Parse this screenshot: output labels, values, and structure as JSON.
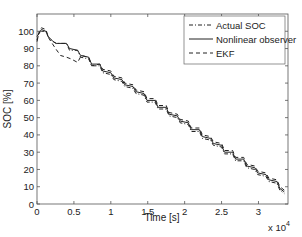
{
  "chart_data": {
    "type": "line",
    "title": "",
    "xlabel": "Time [s]",
    "ylabel": "SOC [%]",
    "x_multiplier_label": "x 10",
    "x_multiplier_exp": "4",
    "xlim": [
      0,
      34000
    ],
    "ylim": [
      0,
      110
    ],
    "xticks": [
      0,
      5000,
      10000,
      15000,
      20000,
      25000,
      30000
    ],
    "xtick_labels": [
      "0",
      "0.5",
      "1",
      "1.5",
      "2",
      "2.5",
      "3"
    ],
    "yticks": [
      0,
      10,
      20,
      30,
      40,
      50,
      60,
      70,
      80,
      90,
      100
    ],
    "ytick_labels": [
      "0",
      "10",
      "20",
      "30",
      "40",
      "50",
      "60",
      "70",
      "80",
      "90",
      "100"
    ],
    "grid": false,
    "legend_position": "upper right",
    "series": [
      {
        "name": "Actual SOC",
        "style": "dashdot",
        "x": [
          0,
          300,
          600,
          1200,
          1500,
          2200,
          2600,
          4000,
          4400,
          5500,
          5900,
          7000,
          7400,
          8500,
          8900,
          10000,
          10400,
          11500,
          11900,
          13000,
          13400,
          14500,
          14900,
          16000,
          16400,
          17500,
          17900,
          19000,
          19400,
          20500,
          20900,
          22000,
          22400,
          23500,
          23900,
          25000,
          25400,
          26500,
          26900,
          28000,
          28400,
          29500,
          29900,
          31000,
          31400,
          32500,
          32900,
          33500
        ],
        "y": [
          95,
          99,
          100,
          100,
          97,
          94,
          93,
          93,
          89,
          89,
          85,
          84,
          80,
          80,
          76,
          75,
          72,
          71,
          68,
          67,
          64,
          63,
          59,
          59,
          55,
          55,
          51,
          50,
          47,
          46,
          42,
          42,
          38,
          37,
          34,
          33,
          29,
          29,
          25,
          25,
          21,
          20,
          17,
          16,
          13,
          12,
          8,
          6
        ]
      },
      {
        "name": "Nonlinear observer",
        "style": "solid",
        "x": [
          0,
          300,
          600,
          1200,
          1500,
          2200,
          2600,
          4000,
          4400,
          5500,
          5900,
          7000,
          7400,
          8500,
          8900,
          10000,
          10400,
          11500,
          11900,
          13000,
          13400,
          14500,
          14900,
          16000,
          16400,
          17500,
          17900,
          19000,
          19400,
          20500,
          20900,
          22000,
          22400,
          23500,
          23900,
          25000,
          25400,
          26500,
          26900,
          28000,
          28400,
          29500,
          29900,
          31000,
          31400,
          32500,
          32900,
          33500
        ],
        "y": [
          97,
          99,
          101,
          100,
          97,
          94,
          93,
          93,
          90,
          89,
          86,
          85,
          81,
          81,
          77,
          76,
          73,
          72,
          69,
          68,
          65,
          64,
          60,
          60,
          56,
          56,
          52,
          51,
          48,
          47,
          43,
          43,
          39,
          38,
          35,
          34,
          30,
          30,
          26,
          26,
          22,
          21,
          18,
          17,
          14,
          13,
          9,
          7
        ]
      },
      {
        "name": "EKF",
        "style": "dashed",
        "x": [
          0,
          300,
          600,
          1200,
          1600,
          2500,
          3200,
          4000,
          4600,
          5500,
          6000,
          7000,
          7400,
          8500,
          8900,
          10000,
          10400,
          11500,
          11900,
          13000,
          13400,
          14500,
          14900,
          16000,
          16400,
          17500,
          17900,
          19000,
          19400,
          20500,
          20900,
          22000,
          22400,
          23500,
          23900,
          25000,
          25400,
          26500,
          26900,
          28000,
          28400,
          29500,
          29900,
          31000,
          31400,
          32500,
          32900,
          33500
        ],
        "y": [
          94,
          100,
          102,
          101,
          96,
          90,
          86,
          85,
          84,
          82,
          86,
          85,
          80,
          81,
          78,
          77,
          74,
          73,
          70,
          69,
          66,
          65,
          61,
          61,
          57,
          57,
          53,
          52,
          49,
          48,
          44,
          44,
          40,
          39,
          36,
          35,
          31,
          31,
          27,
          27,
          23,
          22,
          19,
          18,
          15,
          14,
          10,
          8
        ]
      }
    ]
  }
}
